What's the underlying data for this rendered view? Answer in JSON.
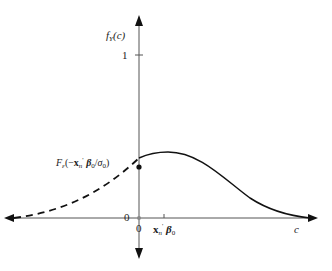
{
  "diagram": {
    "y_axis_label": "f_Y(c)",
    "y_axis_label_main": "f",
    "y_axis_label_sub": "Y",
    "y_axis_label_arg": "(c)",
    "x_axis_label": "c",
    "y_tick_one": "1",
    "y_tick_zero": "0",
    "x_tick_zero": "0",
    "x_tick_mean_label": "x'n β0",
    "x_tick_mean_x": "x",
    "x_tick_mean_sub": "n",
    "x_tick_mean_prime": "'",
    "x_tick_mean_beta": "β",
    "x_tick_mean_beta_sub": "0",
    "point_label": "F_ε(−x'n β0/σ0)",
    "point_label_F": "F",
    "point_label_F_sub": "ε",
    "point_label_open": "(−",
    "point_label_x": "x",
    "point_label_x_sub": "n",
    "point_label_prime": "'",
    "point_label_beta": "β",
    "point_label_beta_sub": "0",
    "point_label_slash": "/",
    "point_label_sigma": "σ",
    "point_label_sigma_sub": "0",
    "point_label_close": ")",
    "colors": {
      "line": "#222222",
      "axis": "#333333"
    }
  }
}
